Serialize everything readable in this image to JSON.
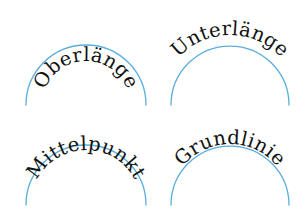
{
  "colors": {
    "background": "#ffffff",
    "arc": "#5aaedc",
    "text": "#111111"
  },
  "panels": [
    {
      "id": "oberlaenge",
      "label": "Oberlänge",
      "alignment": "ascender",
      "arc": {
        "cx": 86,
        "cy": 105,
        "r": 60
      },
      "text_radius": 44,
      "start_offset": "50%"
    },
    {
      "id": "unterlaenge",
      "label": "Unterlänge",
      "alignment": "descender",
      "arc": {
        "cx": 230,
        "cy": 105,
        "r": 59
      },
      "text_radius": 70,
      "start_offset": "50%"
    },
    {
      "id": "mittelpunkt",
      "label": "Mittelpunkt",
      "alignment": "middle",
      "arc": {
        "cx": 86,
        "cy": 205,
        "r": 60
      },
      "text_radius": 55,
      "start_offset": "50%"
    },
    {
      "id": "grundlinie",
      "label": "Grundlinie",
      "alignment": "baseline",
      "arc": {
        "cx": 230,
        "cy": 205,
        "r": 59
      },
      "text_radius": 61,
      "start_offset": "50%"
    }
  ]
}
